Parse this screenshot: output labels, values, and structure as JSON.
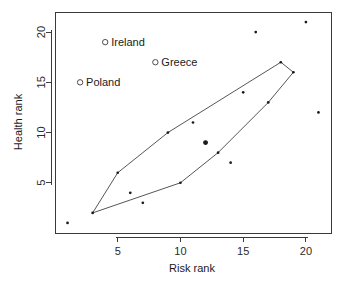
{
  "chart_data": {
    "type": "scatter",
    "title": "",
    "xlabel": "Risk rank",
    "ylabel": "Health rank",
    "xlim": [
      0,
      22
    ],
    "ylim": [
      0,
      22
    ],
    "xticks": [
      5,
      10,
      15,
      20
    ],
    "yticks": [
      5,
      10,
      15,
      20
    ],
    "grid": false,
    "legend": "none",
    "points": [
      {
        "x": 1,
        "y": 1,
        "emphasis": "normal"
      },
      {
        "x": 3,
        "y": 2,
        "emphasis": "normal"
      },
      {
        "x": 5,
        "y": 6,
        "emphasis": "normal"
      },
      {
        "x": 6,
        "y": 4,
        "emphasis": "normal"
      },
      {
        "x": 7,
        "y": 3,
        "emphasis": "normal"
      },
      {
        "x": 9,
        "y": 10,
        "emphasis": "normal"
      },
      {
        "x": 10,
        "y": 5,
        "emphasis": "normal"
      },
      {
        "x": 11,
        "y": 11,
        "emphasis": "normal"
      },
      {
        "x": 12,
        "y": 9,
        "emphasis": "bold"
      },
      {
        "x": 13,
        "y": 8,
        "emphasis": "normal"
      },
      {
        "x": 14,
        "y": 7,
        "emphasis": "normal"
      },
      {
        "x": 15,
        "y": 14,
        "emphasis": "normal"
      },
      {
        "x": 16,
        "y": 20,
        "emphasis": "normal"
      },
      {
        "x": 17,
        "y": 13,
        "emphasis": "normal"
      },
      {
        "x": 18,
        "y": 17,
        "emphasis": "normal"
      },
      {
        "x": 19,
        "y": 16,
        "emphasis": "normal"
      },
      {
        "x": 20,
        "y": 21,
        "emphasis": "normal"
      },
      {
        "x": 21,
        "y": 12,
        "emphasis": "normal"
      }
    ],
    "hull": [
      {
        "x": 3,
        "y": 2
      },
      {
        "x": 5,
        "y": 6
      },
      {
        "x": 9,
        "y": 10
      },
      {
        "x": 18,
        "y": 17
      },
      {
        "x": 19,
        "y": 16
      },
      {
        "x": 17,
        "y": 13
      },
      {
        "x": 13,
        "y": 8
      },
      {
        "x": 10,
        "y": 5
      }
    ],
    "annotations": [
      {
        "label": "Ireland",
        "x": 4,
        "y": 19,
        "marker": "open-circle"
      },
      {
        "label": "Greece",
        "x": 8,
        "y": 17,
        "marker": "open-circle"
      },
      {
        "label": "Poland",
        "x": 2,
        "y": 15,
        "marker": "open-circle"
      }
    ]
  },
  "axes": {
    "x_title": "Risk rank",
    "y_title": "Health rank",
    "x_tick_labels": [
      "5",
      "10",
      "15",
      "20"
    ],
    "y_tick_labels": [
      "5",
      "10",
      "15",
      "20"
    ]
  },
  "colors": {
    "axis": "#3a3a3a",
    "point": "#1a1a1a",
    "hull": "#2b2b2b",
    "background": "#ffffff"
  }
}
